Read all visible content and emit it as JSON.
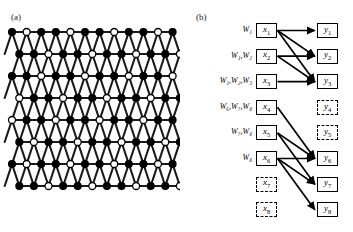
{
  "figure": {
    "panels": [
      {
        "id": "a",
        "label": "(a)",
        "type": "lattice-diagram"
      },
      {
        "id": "b",
        "label": "(b)",
        "type": "bipartite-graph"
      }
    ]
  },
  "panel_a": {
    "label": "(a)",
    "description": "Triangular/kagome-like lattice network with filled black nodes and open white nodes connected by thick black edges",
    "node_types": [
      {
        "name": "filled-node",
        "fill": "#000000",
        "stroke": "#000000"
      },
      {
        "name": "open-node",
        "fill": "#ffffff",
        "stroke": "#000000"
      }
    ],
    "edge_color": "#1a1a1a",
    "rows": 7,
    "columns": 13
  },
  "panel_b": {
    "label": "(b)",
    "x_nodes": [
      {
        "id": "x1",
        "label": "x",
        "sub": "1",
        "style": "solid",
        "w_label": "W",
        "w_subs": [
          "1"
        ]
      },
      {
        "id": "x2",
        "label": "x",
        "sub": "2",
        "style": "solid",
        "w_label": "W",
        "w_subs": [
          "1",
          "2"
        ]
      },
      {
        "id": "x3",
        "label": "x",
        "sub": "3",
        "style": "solid",
        "w_label": "W",
        "w_subs": [
          "1",
          "2",
          "3"
        ]
      },
      {
        "id": "x4",
        "label": "x",
        "sub": "4",
        "style": "solid",
        "w_label": "W",
        "w_subs": [
          "6",
          "7",
          "8"
        ]
      },
      {
        "id": "x5",
        "label": "x",
        "sub": "5",
        "style": "solid",
        "w_label": "W",
        "w_subs": [
          "7",
          "8"
        ]
      },
      {
        "id": "x6",
        "label": "x",
        "sub": "6",
        "style": "solid",
        "w_label": "W",
        "w_subs": [
          "8"
        ]
      },
      {
        "id": "x7",
        "label": "x",
        "sub": "7",
        "style": "dashed",
        "w_label": "",
        "w_subs": []
      },
      {
        "id": "x8",
        "label": "x",
        "sub": "8",
        "style": "dashed",
        "w_label": "",
        "w_subs": []
      }
    ],
    "y_nodes": [
      {
        "id": "y1",
        "label": "y",
        "sub": "1",
        "style": "solid"
      },
      {
        "id": "y2",
        "label": "y",
        "sub": "2",
        "style": "solid"
      },
      {
        "id": "y3",
        "label": "y",
        "sub": "3",
        "style": "solid"
      },
      {
        "id": "y4",
        "label": "y",
        "sub": "4",
        "style": "dashed"
      },
      {
        "id": "y5",
        "label": "y",
        "sub": "5",
        "style": "dashed"
      },
      {
        "id": "y6",
        "label": "y",
        "sub": "6",
        "style": "solid"
      },
      {
        "id": "y7",
        "label": "y",
        "sub": "7",
        "style": "solid"
      },
      {
        "id": "y8",
        "label": "y",
        "sub": "8",
        "style": "solid"
      }
    ],
    "edges": [
      {
        "from": "x1",
        "to": "y1"
      },
      {
        "from": "x1",
        "to": "y2"
      },
      {
        "from": "x1",
        "to": "y3"
      },
      {
        "from": "x2",
        "to": "y2"
      },
      {
        "from": "x2",
        "to": "y3"
      },
      {
        "from": "x3",
        "to": "y3"
      },
      {
        "from": "x4",
        "to": "y6"
      },
      {
        "from": "x5",
        "to": "y6"
      },
      {
        "from": "x5",
        "to": "y7"
      },
      {
        "from": "x6",
        "to": "y6"
      },
      {
        "from": "x6",
        "to": "y7"
      },
      {
        "from": "x6",
        "to": "y8"
      }
    ],
    "w_labels": [
      {
        "for": "x1",
        "text": "W₁"
      },
      {
        "for": "x2",
        "text": "W₁,W₂"
      },
      {
        "for": "x3",
        "text": "W₁,W₂,W₃"
      },
      {
        "for": "x4",
        "text": "W₆,W₇,W₈"
      },
      {
        "for": "x5",
        "text": "W₇,W₈"
      },
      {
        "for": "x6",
        "text": "W₈"
      }
    ]
  },
  "colors": {
    "ink": "#000000",
    "paper": "#ffffff",
    "edge": "#1a1a1a"
  }
}
